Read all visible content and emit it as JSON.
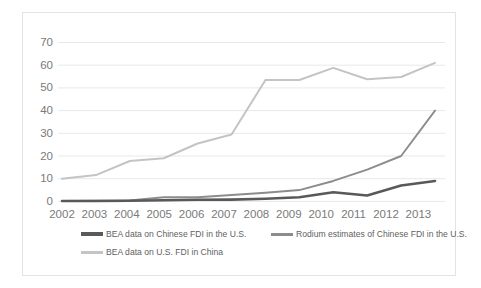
{
  "chart_data": {
    "type": "line",
    "title": "",
    "subtitle": "",
    "xlabel": "",
    "ylabel": "",
    "categories": [
      "2002",
      "2003",
      "2004",
      "2005",
      "2006",
      "2007",
      "2008",
      "2009",
      "2010",
      "2011",
      "2012",
      "2013"
    ],
    "x": [
      2002,
      2003,
      2004,
      2005,
      2006,
      2007,
      2008,
      2009,
      2010,
      2011,
      2012,
      2013
    ],
    "ylim": [
      0,
      70
    ],
    "yticks": [
      0,
      10,
      20,
      30,
      40,
      50,
      60,
      70
    ],
    "ytick_labels": [
      "0",
      "10",
      "20",
      "30",
      "40",
      "50",
      "60",
      "70"
    ],
    "grid": true,
    "legend_position": "bottom",
    "series": [
      {
        "name": "BEA data on Chinese FDI in the U.S.",
        "color": "#595959",
        "width": 2.6,
        "values": [
          0.2,
          0.2,
          0.3,
          0.5,
          0.7,
          0.8,
          1.2,
          1.8,
          4.0,
          2.6,
          7.0,
          9.0
        ]
      },
      {
        "name": "Rodium estimates of Chinese FDI in the U.S.",
        "color": "#8c8c8c",
        "width": 1.9,
        "values": [
          0.2,
          0.3,
          0.4,
          1.8,
          1.8,
          2.8,
          3.8,
          5.0,
          9.0,
          14.0,
          20.0,
          40.0
        ]
      },
      {
        "name": "BEA data on U.S. FDI in China",
        "color": "#c4c4c4",
        "width": 2.0,
        "values": [
          10.0,
          11.6,
          17.8,
          19.0,
          25.5,
          29.5,
          53.5,
          53.5,
          58.8,
          53.8,
          54.8,
          61.0
        ]
      }
    ]
  },
  "legend": {
    "entries": [
      {
        "label": "BEA data on Chinese FDI in the U.S."
      },
      {
        "label": "Rodium estimates of Chinese FDI in the U.S."
      },
      {
        "label": "BEA data on U.S. FDI in China"
      }
    ]
  },
  "colors": {
    "series_dark": "#595959",
    "series_medium": "#8c8c8c",
    "series_light": "#c4c4c4",
    "gridline": "#e8e8e8",
    "tick_text": "#7a7a7a",
    "frame_border": "#e3e3e3",
    "background": "#ffffff"
  }
}
